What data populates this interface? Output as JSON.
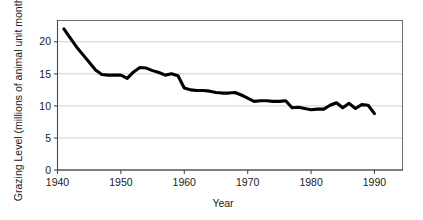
{
  "chart_data": {
    "type": "line",
    "title": "",
    "xlabel": "Year",
    "ylabel": "Grazing Level (millions of animal unit months)",
    "xlim": [
      1940,
      1994.5
    ],
    "ylim": [
      0,
      23.4
    ],
    "xticks": [
      1940,
      1950,
      1960,
      1970,
      1980,
      1990
    ],
    "xticklabels": [
      "1940",
      "1950",
      "1960",
      "1970",
      "1980",
      "1990"
    ],
    "yticks": [
      0,
      5,
      10,
      15,
      20
    ],
    "yticklabels": [
      "0",
      "5",
      "10",
      "15",
      "20"
    ],
    "grid": "horizontal",
    "legend": "none",
    "series": [
      {
        "name": "Grazing Level",
        "x": [
          1941,
          1942,
          1943,
          1944,
          1945,
          1946,
          1947,
          1948,
          1949,
          1950,
          1951,
          1952,
          1953,
          1954,
          1955,
          1956,
          1957,
          1958,
          1959,
          1960,
          1961,
          1962,
          1963,
          1964,
          1965,
          1966,
          1967,
          1968,
          1969,
          1970,
          1971,
          1972,
          1973,
          1974,
          1975,
          1976,
          1977,
          1978,
          1979,
          1980,
          1981,
          1982,
          1983,
          1984,
          1985,
          1986,
          1987,
          1988,
          1989,
          1990
        ],
        "values": [
          22.0,
          20.6,
          19.2,
          18.0,
          16.8,
          15.6,
          14.9,
          14.8,
          14.8,
          14.8,
          14.3,
          15.3,
          16.0,
          15.9,
          15.5,
          15.2,
          14.8,
          15.0,
          14.7,
          12.8,
          12.5,
          12.4,
          12.4,
          12.3,
          12.1,
          12.0,
          12.0,
          12.1,
          11.7,
          11.2,
          10.7,
          10.8,
          10.8,
          10.7,
          10.7,
          10.8,
          9.7,
          9.8,
          9.6,
          9.4,
          9.5,
          9.5,
          10.1,
          10.5,
          9.7,
          10.4,
          9.6,
          10.2,
          10.1,
          8.8
        ]
      }
    ]
  },
  "axes": {
    "x_title": "Year",
    "y_title": "Grazing Level (millions of animal unit months)"
  }
}
